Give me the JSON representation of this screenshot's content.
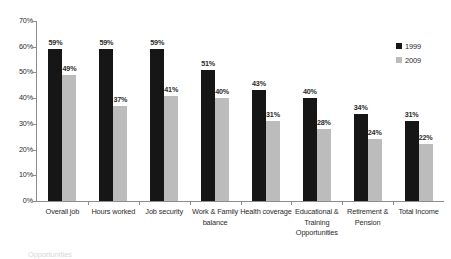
{
  "chart_data": {
    "type": "bar",
    "title": "",
    "subtitle": "",
    "xlabel": "",
    "ylabel": "",
    "ylim": [
      0,
      70
    ],
    "ytick_labels": [
      "0%",
      "10%",
      "20%",
      "30%",
      "40%",
      "50%",
      "60%",
      "70%"
    ],
    "ytick_values": [
      0,
      10,
      20,
      30,
      40,
      50,
      60,
      70
    ],
    "grid": false,
    "legend_position": "top-right",
    "categories": [
      "Overall job",
      "Hours worked",
      "Job security",
      "Work & Family balance",
      "Health coverage",
      "Educational & Training Opportunities",
      "Retirement & Pension",
      "Total Income"
    ],
    "series": [
      {
        "name": "1999",
        "color": "#161616",
        "values": [
          59,
          59,
          59,
          51,
          43,
          40,
          34,
          31
        ],
        "labels": [
          "59%",
          "59%",
          "59%",
          "51%",
          "43%",
          "40%",
          "34%",
          "31%"
        ]
      },
      {
        "name": "2009",
        "color": "#bcbcbc",
        "values": [
          49,
          37,
          41,
          40,
          31,
          28,
          24,
          22
        ],
        "labels": [
          "49%",
          "37%",
          "41%",
          "40%",
          "31%",
          "28%",
          "24%",
          "22%"
        ]
      }
    ]
  },
  "legend": {
    "entries": [
      {
        "label": "1999",
        "color": "#161616"
      },
      {
        "label": "2009",
        "color": "#bcbcbc"
      }
    ]
  },
  "caption": {
    "clipped_text": "Opportunities"
  }
}
